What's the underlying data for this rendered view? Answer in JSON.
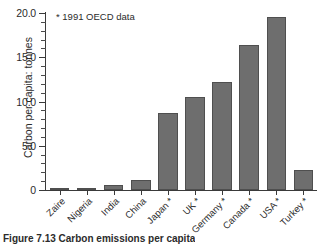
{
  "figure": {
    "caption": "Figure 7.13  Carbon emissions per capita",
    "annotation": "* 1991 OECD data"
  },
  "chart_data": {
    "type": "bar",
    "title": "",
    "xlabel": "",
    "ylabel": "Carbon per capita: tonnes",
    "ylim": [
      0,
      20
    ],
    "ytick_labels": [
      "0",
      "5.0",
      "10.0",
      "15.0",
      "20.0"
    ],
    "ytick_values": [
      0,
      5,
      10,
      15,
      20
    ],
    "minor_tick_interval": 1,
    "grid": false,
    "legend": "none",
    "bar_color": "#6e6e6e",
    "bar_edge_color": "#4f4f4f",
    "annotation": "* 1991 OECD data",
    "categories": [
      "Zaire",
      "Nigeria",
      "India",
      "China",
      "Japan *",
      "UK *",
      "Germany *",
      "Canada *",
      "USA *",
      "Turkey *"
    ],
    "values": [
      0.15,
      0.25,
      0.6,
      1.1,
      8.7,
      10.5,
      12.2,
      16.4,
      19.6,
      2.3
    ]
  }
}
